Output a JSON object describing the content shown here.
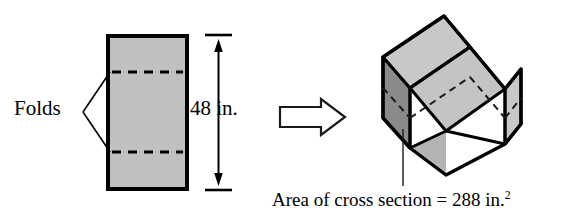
{
  "figure": {
    "width": 570,
    "height": 219
  },
  "flat_sheet": {
    "name": "rectangular-sheet",
    "fill_color": "#c0c0c0",
    "stroke_color": "#000000",
    "fold_lines": 2,
    "fold_line_style": "dashed"
  },
  "folds_callout": {
    "label": "Folds",
    "leader_style": "bracket"
  },
  "dimension": {
    "label": "48 in.",
    "value": 48,
    "unit": "in.",
    "orientation": "vertical",
    "arrow_style": "double-headed"
  },
  "transform_arrow": {
    "name": "right-arrow",
    "direction": "right",
    "style": "hollow-outline"
  },
  "folded_shape": {
    "name": "u-channel",
    "description": "Open-top channel formed by folding the sheet along the two fold lines",
    "face_light_color": "#c8c8c8",
    "face_mid_color": "#b4b4b4",
    "face_dark_color": "#8a8a8a",
    "stroke_color": "#000000",
    "hidden_edge_style": "dashed"
  },
  "caption": {
    "text_prefix": "Area of cross section = 288 in.",
    "exponent": "2",
    "full_text": "Area of cross section = 288 in.²",
    "area_value": 288,
    "area_unit": "in.²",
    "leader_line": true
  }
}
